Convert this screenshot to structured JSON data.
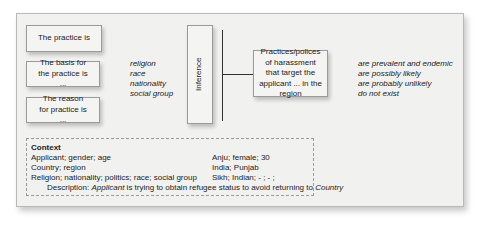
{
  "diagram": {
    "left_boxes": [
      {
        "label": "The practice is"
      },
      {
        "label": "The basis for the practice is ..."
      },
      {
        "label": "The reason for practice is ..."
      }
    ],
    "grounds_list": [
      "religion",
      "race",
      "nationality",
      "social group"
    ],
    "inference_label": "Inference",
    "target_box": {
      "label": "Practices/polices of harassment that target the applicant ... in the region"
    },
    "likelihood_list": [
      "are prevalent and endemic",
      "are possibly likely",
      "are probably unlikely",
      "do not exist"
    ],
    "context": {
      "title": "Context",
      "fields": [
        "Applicant; gender; age",
        "Country; region",
        "Religion; nationality; politics; race; social group"
      ],
      "values": [
        "Anju; female; 30",
        "India; Punjab",
        "Sikh; Indian; - ; - ;"
      ],
      "description": {
        "prefix": "Description: ",
        "subject": "Applicant",
        "middle": " is trying to obtain refugee status to avoid returning to ",
        "object": "Country"
      }
    }
  }
}
